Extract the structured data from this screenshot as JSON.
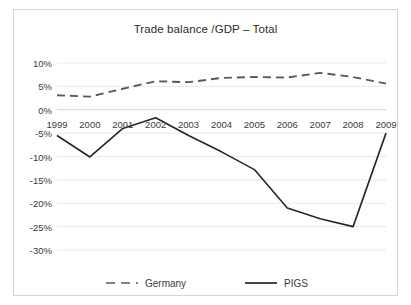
{
  "chart_data": {
    "type": "line",
    "title": "Trade balance /GDP – Total",
    "xlabel": "",
    "ylabel": "",
    "categories": [
      "1999",
      "2000",
      "2001",
      "2002",
      "2003",
      "2004",
      "2005",
      "2006",
      "2007",
      "2008",
      "2009"
    ],
    "x": [
      1999,
      2000,
      2001,
      2002,
      2003,
      2004,
      2005,
      2006,
      2007,
      2008,
      2009
    ],
    "series": [
      {
        "name": "Germany",
        "style": "dashed",
        "color": "#595959",
        "values": [
          3.1,
          2.8,
          4.5,
          6.1,
          5.9,
          6.8,
          7.0,
          6.9,
          7.9,
          7.0,
          5.6
        ]
      },
      {
        "name": "PIGS",
        "style": "solid",
        "color": "#262626",
        "values": [
          -5.5,
          -10.1,
          -4.0,
          -1.7,
          -5.5,
          -9.0,
          -12.8,
          -21.0,
          -23.3,
          -25.0,
          -5.0
        ]
      }
    ],
    "ylim": [
      -30,
      10
    ],
    "ytick_values": [
      10,
      5,
      0,
      -5,
      -10,
      -15,
      -20,
      -25,
      -30
    ],
    "ytick_labels": [
      "10%",
      "5%",
      "0%",
      "-5%",
      "-10%",
      "-15%",
      "-20%",
      "-25%",
      "-30%"
    ],
    "grid": true,
    "grid_color": "#e8e8e8",
    "legend_position": "bottom",
    "legend_entries": [
      "Germany",
      "PIGS"
    ],
    "xaxis_line_value": 0,
    "xtick_label_position": "below-zero-axis",
    "border_color": "#d6d6d6",
    "background": "#ffffff"
  }
}
